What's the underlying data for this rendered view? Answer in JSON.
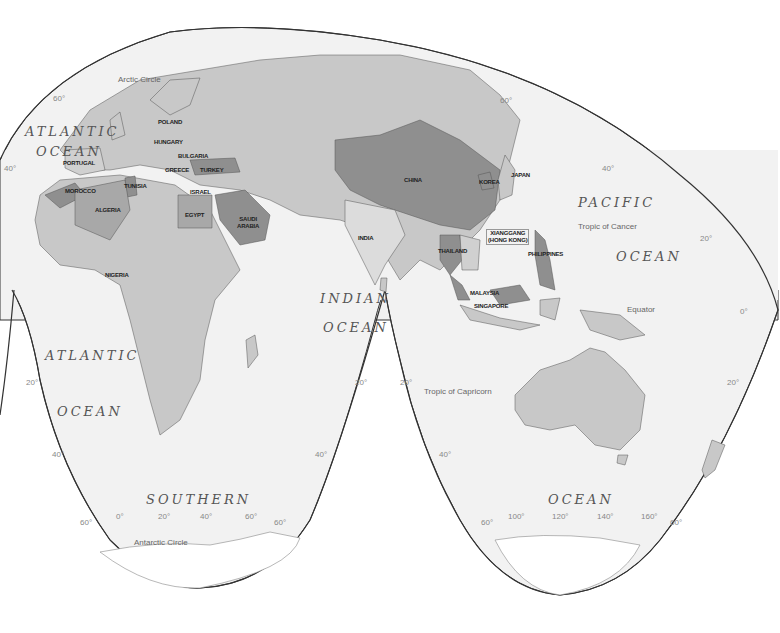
{
  "map": {
    "projection": "interrupted-homolosine",
    "colors": {
      "ocean": "#f2f2f2",
      "land": "#c8c8c8",
      "land_light": "#d8d8d8",
      "highlight": "#8f8f8f",
      "highlight_medium": "#a8a8a8",
      "boundary": "#333333",
      "antarctica": "#ffffff"
    },
    "oceans": [
      {
        "id": "atlantic-north-1",
        "text": "ATLANTIC"
      },
      {
        "id": "atlantic-north-2",
        "text": "OCEAN"
      },
      {
        "id": "atlantic-south-1",
        "text": "ATLANTIC"
      },
      {
        "id": "atlantic-south-2",
        "text": "OCEAN"
      },
      {
        "id": "pacific-1",
        "text": "PACIFIC"
      },
      {
        "id": "pacific-2",
        "text": "OCEAN"
      },
      {
        "id": "indian-1",
        "text": "INDIAN"
      },
      {
        "id": "indian-2",
        "text": "OCEAN"
      },
      {
        "id": "southern-1",
        "text": "SOUTHERN"
      },
      {
        "id": "southern-2",
        "text": "OCEAN"
      }
    ],
    "countries": [
      {
        "name": "POLAND",
        "highlight": "none"
      },
      {
        "name": "HUNGARY",
        "highlight": "none"
      },
      {
        "name": "BULGARIA",
        "highlight": "none"
      },
      {
        "name": "GREECE",
        "highlight": "none"
      },
      {
        "name": "TURKEY",
        "highlight": "strong"
      },
      {
        "name": "PORTUGAL",
        "highlight": "none"
      },
      {
        "name": "MOROCCO",
        "highlight": "strong"
      },
      {
        "name": "TUNISIA",
        "highlight": "strong"
      },
      {
        "name": "ALGERIA",
        "highlight": "medium"
      },
      {
        "name": "ISRAEL",
        "highlight": "none"
      },
      {
        "name": "EGYPT",
        "highlight": "medium"
      },
      {
        "name": "SAUDI ARABIA",
        "highlight": "strong"
      },
      {
        "name": "NIGERIA",
        "highlight": "none"
      },
      {
        "name": "CHINA",
        "highlight": "strong"
      },
      {
        "name": "INDIA",
        "highlight": "light"
      },
      {
        "name": "KOREA",
        "highlight": "strong"
      },
      {
        "name": "JAPAN",
        "highlight": "none"
      },
      {
        "name": "XIANGGANG (HONG KONG)",
        "highlight": "none"
      },
      {
        "name": "THAILAND",
        "highlight": "strong"
      },
      {
        "name": "PHILIPPINES",
        "highlight": "strong"
      },
      {
        "name": "MALAYSIA",
        "highlight": "strong"
      },
      {
        "name": "SINGAPORE",
        "highlight": "none"
      }
    ],
    "hk_line1": "XIANGGANG",
    "hk_line2": "(HONG KONG)",
    "saudi_line1": "SAUDI",
    "saudi_line2": "ARABIA",
    "reference_lines": {
      "arctic_circle": "Arctic Circle",
      "tropic_cancer": "Tropic of Cancer",
      "equator": "Equator",
      "tropic_capricorn": "Tropic of Capricorn",
      "antarctic_circle": "Antarctic Circle"
    },
    "graticule_labels": {
      "lat_60n_w": "60°",
      "lat_40n_w": "40°",
      "lat_60n_e": "60°",
      "lat_40n_e": "40°",
      "lat_20n_e": "20°",
      "lat_0_e": "0°",
      "lat_20s_w": "20°",
      "lat_20s_mid_l": "20°",
      "lat_20s_mid_r": "20°",
      "lat_20s_e": "20°",
      "lat_40s_w": "40°",
      "lat_40s_mid_l": "40°",
      "lat_40s_mid_r": "40°",
      "lat_60s_w": "60°",
      "lat_60s_mid_l": "60°",
      "lat_60s_mid_r": "60°",
      "lat_60s_e": "60°",
      "lon_0": "0°",
      "lon_20": "20°",
      "lon_40": "40°",
      "lon_60": "60°",
      "lon_100": "100°",
      "lon_120": "120°",
      "lon_140": "140°",
      "lon_160": "160°"
    }
  }
}
